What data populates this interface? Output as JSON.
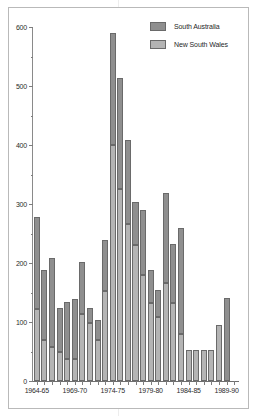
{
  "legend": {
    "position": "top-right",
    "entries": [
      {
        "label": "South Australia",
        "color": "#8f8f8f",
        "key": "south_australia"
      },
      {
        "label": "New South Wales",
        "color": "#b4b4b4",
        "key": "new_south_wales"
      }
    ]
  },
  "chart_data": {
    "type": "bar",
    "stacked": true,
    "title": "",
    "subtitle": "",
    "xlabel": "",
    "ylabel": "",
    "ylim": [
      0,
      600
    ],
    "yticks": [
      0,
      100,
      200,
      300,
      400,
      500,
      600
    ],
    "yticks_minor": [
      50,
      150,
      250,
      350,
      450,
      550
    ],
    "ytick_labels": [
      "0",
      "100",
      "200",
      "300",
      "400",
      "500",
      "600"
    ],
    "grid": false,
    "legend_position": "top-right",
    "categories": [
      "1964-65",
      "1965-66",
      "1966-67",
      "1967-68",
      "1968-69",
      "1969-70",
      "1970-71",
      "1971-72",
      "1972-73",
      "1973-74",
      "1974-75",
      "1975-76",
      "1976-77",
      "1977-78",
      "1978-79",
      "1979-80",
      "1980-81",
      "1981-82",
      "1982-83",
      "1983-84",
      "1984-85",
      "1985-86",
      "1986-87",
      "1987-88",
      "1988-89",
      "1989-90",
      "1990-91"
    ],
    "xtick_labels": [
      "1964-65",
      "1969-70",
      "1974-75",
      "1979-80",
      "1984-85",
      "1989-90"
    ],
    "xtick_indices": [
      0,
      5,
      10,
      15,
      20,
      25
    ],
    "series": [
      {
        "name": "New South Wales",
        "color": "#b4b4b4",
        "values": [
          122,
          70,
          57,
          50,
          38,
          38,
          113,
          98,
          70,
          152,
          400,
          325,
          266,
          230,
          180,
          132,
          108,
          166,
          132,
          79,
          52,
          53,
          52,
          52,
          95,
          0,
          0
        ]
      },
      {
        "name": "South Australia",
        "color": "#8f8f8f",
        "values": [
          156,
          119,
          152,
          73,
          96,
          101,
          89,
          25,
          33,
          87,
          190,
          189,
          142,
          74,
          110,
          57,
          47,
          153,
          100,
          180,
          0,
          0,
          0,
          0,
          0,
          140,
          0
        ]
      }
    ],
    "totals": [
      278,
      189,
      209,
      123,
      134,
      139,
      202,
      123,
      103,
      239,
      590,
      514,
      408,
      304,
      290,
      189,
      155,
      319,
      232,
      259,
      87,
      53,
      52,
      52,
      95,
      140,
      0
    ]
  }
}
